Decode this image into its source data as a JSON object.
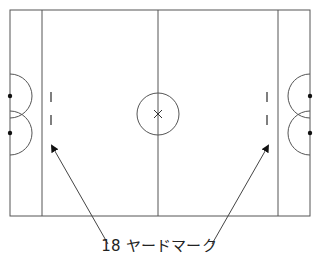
{
  "diagram": {
    "type": "field-layout",
    "colors": {
      "line": "#555555",
      "marker": "#111111",
      "arrow": "#444444",
      "background": "#ffffff"
    },
    "field": {
      "x": 10,
      "y": 10,
      "width": 300,
      "height": 206
    },
    "zone_lines_x": [
      42,
      278
    ],
    "center_line_x": 158,
    "center_circle": {
      "cx": 158,
      "cy": 114,
      "r": 21,
      "mark": "x"
    },
    "goal_arcs": {
      "left": [
        {
          "cx": 10,
          "cy": 96,
          "r": 22
        },
        {
          "cx": 10,
          "cy": 133,
          "r": 22
        }
      ],
      "right": [
        {
          "cx": 310,
          "cy": 96,
          "r": 22
        },
        {
          "cx": 310,
          "cy": 133,
          "r": 22
        }
      ]
    },
    "goal_posts": [
      {
        "x": 10,
        "y": 96
      },
      {
        "x": 10,
        "y": 133
      },
      {
        "x": 310,
        "y": 96
      },
      {
        "x": 310,
        "y": 133
      }
    ],
    "yard_marks": {
      "left_x": 51,
      "right_x": 267,
      "segments": [
        [
          92,
          102
        ],
        [
          115,
          125
        ]
      ]
    },
    "label": {
      "text": "18 ヤードマーク",
      "arrows": [
        {
          "from": [
            108,
            244
          ],
          "to": [
            52,
            146
          ]
        },
        {
          "from": [
            212,
            244
          ],
          "to": [
            268,
            146
          ]
        }
      ]
    }
  }
}
